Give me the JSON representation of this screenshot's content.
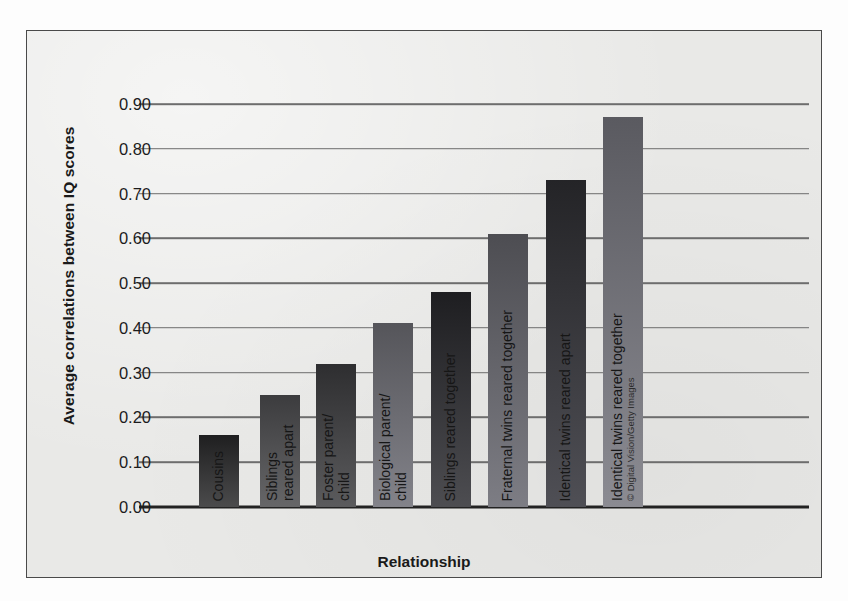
{
  "figure": {
    "background_color": "#e9e9e7",
    "border_color": "#4a4a4a",
    "credit": "© Digital Vision/Getty Images"
  },
  "chart_data": {
    "type": "bar",
    "title": "",
    "xlabel": "Relationship",
    "ylabel": "Average correlations between IQ scores",
    "ylim": [
      0.0,
      0.9
    ],
    "grid": true,
    "legend": "none",
    "ytick_labels": [
      "0.90",
      "0.80",
      "0.70",
      "0.60",
      "0.50",
      "0.40",
      "0.30",
      "0.20",
      "0.10",
      "0.00"
    ],
    "ytick_values": [
      0.9,
      0.8,
      0.7,
      0.6,
      0.5,
      0.4,
      0.3,
      0.2,
      0.1,
      0.0
    ],
    "categories": [
      "Cousins",
      "Siblings reared apart",
      "Foster parent/child",
      "Biological parent/child",
      "Siblings reared together",
      "Fraternal twins reared together",
      "Identical twins reared apart",
      "Identical twins reared together"
    ],
    "values": [
      0.16,
      0.25,
      0.32,
      0.41,
      0.48,
      0.61,
      0.73,
      0.87
    ],
    "bars": [
      {
        "label_line1": "Cousins",
        "label_line2": "",
        "value": 0.16,
        "x": 46,
        "color_top": "#1f1f20",
        "color_bottom": "#4b4b4c"
      },
      {
        "label_line1": "Siblings",
        "label_line2": "reared apart",
        "value": 0.25,
        "x": 107,
        "color_top": "#3c3c3e",
        "color_bottom": "#666668"
      },
      {
        "label_line1": "Foster parent/",
        "label_line2": "child",
        "value": 0.32,
        "x": 163,
        "color_top": "#2e2e30",
        "color_bottom": "#5b5b5d"
      },
      {
        "label_line1": "Biological parent/",
        "label_line2": "child",
        "value": 0.41,
        "x": 220,
        "color_top": "#55555a",
        "color_bottom": "#83838a"
      },
      {
        "label_line1": "Siblings reared together",
        "label_line2": "",
        "value": 0.48,
        "x": 278,
        "color_top": "#1e1e21",
        "color_bottom": "#4d4d51"
      },
      {
        "label_line1": "Fraternal twins reared together",
        "label_line2": "",
        "value": 0.61,
        "x": 335,
        "color_top": "#4d4d52",
        "color_bottom": "#7d7d84"
      },
      {
        "label_line1": "Identical twins reared apart",
        "label_line2": "",
        "value": 0.73,
        "x": 393,
        "color_top": "#242427",
        "color_bottom": "#4f4f55"
      },
      {
        "label_line1": "Identical twins reared together",
        "label_line2": "© Digital Vision/Getty Images",
        "value": 0.87,
        "x": 450,
        "color_top": "#5a5a60",
        "color_bottom": "#8b8b92"
      }
    ]
  }
}
